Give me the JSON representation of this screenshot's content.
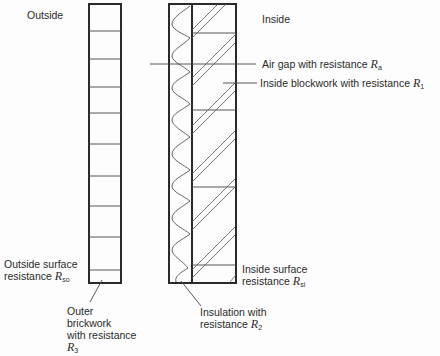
{
  "diagram": {
    "type": "cavity wall cross-section with thermal resistances",
    "colors": {
      "line": "#2a2a2a",
      "thin_line": "#555555",
      "background": "#fdfdfd"
    },
    "side_labels": {
      "outside": "Outside",
      "inside": "Inside"
    },
    "labels": {
      "air_gap": {
        "text": "Air gap with resistance ",
        "symbol": "R",
        "sub": "a"
      },
      "inside_blockwork": {
        "text": "Inside blockwork with resistance ",
        "symbol": "R",
        "sub": "1"
      },
      "outside_surface": {
        "line1": "Outside surface",
        "line2": "resistance ",
        "symbol": "R",
        "sub": "so"
      },
      "inside_surface": {
        "line1": "Inside surface",
        "line2": "resistance ",
        "symbol": "R",
        "sub": "si"
      },
      "insulation": {
        "line1": "Insulation with",
        "line2": "resistance ",
        "symbol": "R",
        "sub": "2"
      },
      "outer_brickwork": {
        "line1": "Outer",
        "line2": "brickwork",
        "line3": "with resistance",
        "symbol": "R",
        "sub": "3"
      }
    },
    "layers": [
      {
        "name": "Outside surface",
        "resistance": "Rso"
      },
      {
        "name": "Outer brickwork",
        "resistance": "R3"
      },
      {
        "name": "Air gap",
        "resistance": "Ra"
      },
      {
        "name": "Insulation",
        "resistance": "R2"
      },
      {
        "name": "Inside blockwork",
        "resistance": "R1"
      },
      {
        "name": "Inside surface",
        "resistance": "Rsi"
      }
    ]
  }
}
